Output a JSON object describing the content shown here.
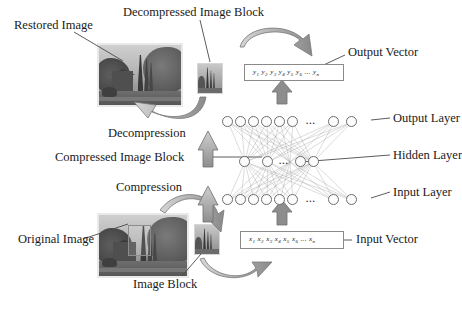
{
  "diagram": {
    "labels": {
      "restored_image": "Restored Image",
      "decompressed_image_block": "Decompressed Image Block",
      "output_vector": "Output Vector",
      "output_layer": "Output Layer",
      "hidden_layer": "Hidden Layer",
      "input_layer": "Input Layer",
      "input_vector": "Input Vector",
      "decompression": "Decompression",
      "compressed_image_block": "Compressed Image Block",
      "compression": "Compression",
      "original_image": "Original Image",
      "image_block": "Image Block"
    },
    "vectors": {
      "output": {
        "symbols": [
          "y",
          "y",
          "y",
          "y",
          "y",
          "y"
        ],
        "subscripts": [
          "1",
          "2",
          "3",
          "4",
          "5",
          "6"
        ],
        "ellipsis": "...",
        "last_symbol": "y",
        "last_subscript": "n",
        "text": "y1 y2 y3 y4 y5 y6 ... yn"
      },
      "input": {
        "symbols": [
          "x",
          "x",
          "x",
          "x",
          "x",
          "x"
        ],
        "subscripts": [
          "1",
          "2",
          "3",
          "4",
          "5",
          "6"
        ],
        "ellipsis": "...",
        "last_symbol": "x",
        "last_subscript": "n",
        "text": "x1 x2 x3 x4 x5 x6 ... xn"
      }
    },
    "network": {
      "output_layer": {
        "visible_nodes": 6,
        "tail_nodes": 2,
        "ellipsis": "..."
      },
      "hidden_layer": {
        "visible_nodes": 2,
        "tail_nodes": 2,
        "ellipsis": "..."
      },
      "input_layer": {
        "visible_nodes": 6,
        "tail_nodes": 2,
        "ellipsis": "..."
      }
    },
    "colors": {
      "arrow_fill": "#9a9a9a",
      "arrow_stroke": "#6f6f6f",
      "node_stroke": "#6d6d6d",
      "text": "#1a1a1a",
      "box_stroke": "#8a8a8a",
      "background": "#ffffff"
    }
  }
}
